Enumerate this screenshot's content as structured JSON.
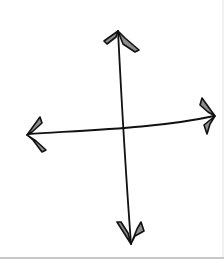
{
  "image": {
    "description": "Hand-drawn four-way arrow (up, down, left, right) crossing at center",
    "icon": "move-arrows-icon",
    "arrows": [
      {
        "direction": "up",
        "icon": "arrow-up-icon"
      },
      {
        "direction": "down",
        "icon": "arrow-down-icon"
      },
      {
        "direction": "left",
        "icon": "arrow-left-icon"
      },
      {
        "direction": "right",
        "icon": "arrow-right-icon"
      }
    ],
    "colors": {
      "stroke": "#111111",
      "arrowhead_fill": "#8c8c8c",
      "background": "#ffffff",
      "rule": "#c8c8c8"
    }
  }
}
